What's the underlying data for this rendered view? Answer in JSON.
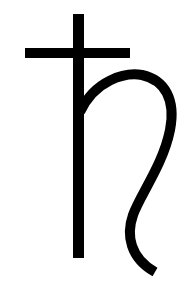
{
  "image": {
    "subject": "Saturn astrological symbol",
    "glyph": "♄",
    "icon": "saturn-symbol-icon",
    "colors": {
      "background": "#ffffff",
      "stroke": "#000000"
    }
  }
}
